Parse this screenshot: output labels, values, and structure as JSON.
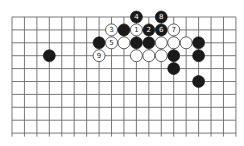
{
  "board": {
    "columns": 19,
    "visible_rows": 10,
    "origin_x": 12,
    "origin_y": 17,
    "spacing_x": 12.44,
    "spacing_y": 12.9,
    "stone_radius": 6,
    "line_color": "#6a6a6a",
    "open_bottom": true
  },
  "stones": [
    {
      "col": 10,
      "row": 0,
      "color": "black",
      "label": "4"
    },
    {
      "col": 12,
      "row": 0,
      "color": "black",
      "label": "8"
    },
    {
      "col": 8,
      "row": 1,
      "color": "white",
      "label": "3"
    },
    {
      "col": 9,
      "row": 1,
      "color": "black",
      "label": ""
    },
    {
      "col": 10,
      "row": 1,
      "color": "white",
      "label": "1"
    },
    {
      "col": 11,
      "row": 1,
      "color": "black",
      "label": "2"
    },
    {
      "col": 12,
      "row": 1,
      "color": "black",
      "label": "6"
    },
    {
      "col": 13,
      "row": 1,
      "color": "white",
      "label": "7"
    },
    {
      "col": 7,
      "row": 2,
      "color": "black",
      "label": ""
    },
    {
      "col": 8,
      "row": 2,
      "color": "white",
      "label": "5"
    },
    {
      "col": 9,
      "row": 2,
      "color": "white",
      "label": ""
    },
    {
      "col": 10,
      "row": 2,
      "color": "black",
      "label": ""
    },
    {
      "col": 11,
      "row": 2,
      "color": "black",
      "label": ""
    },
    {
      "col": 12,
      "row": 2,
      "color": "white",
      "label": ""
    },
    {
      "col": 13,
      "row": 2,
      "color": "white",
      "label": ""
    },
    {
      "col": 14,
      "row": 2,
      "color": "white",
      "label": ""
    },
    {
      "col": 15,
      "row": 2,
      "color": "black",
      "label": ""
    },
    {
      "col": 3,
      "row": 3,
      "color": "black",
      "label": ""
    },
    {
      "col": 7,
      "row": 3,
      "color": "white",
      "label": "9"
    },
    {
      "col": 10,
      "row": 3,
      "color": "white",
      "label": ""
    },
    {
      "col": 11,
      "row": 3,
      "color": "white",
      "label": ""
    },
    {
      "col": 12,
      "row": 3,
      "color": "white",
      "label": ""
    },
    {
      "col": 13,
      "row": 3,
      "color": "black",
      "label": ""
    },
    {
      "col": 15,
      "row": 3,
      "color": "black",
      "label": ""
    },
    {
      "col": 13,
      "row": 4,
      "color": "black",
      "label": ""
    },
    {
      "col": 15,
      "row": 5,
      "color": "black",
      "label": ""
    }
  ]
}
